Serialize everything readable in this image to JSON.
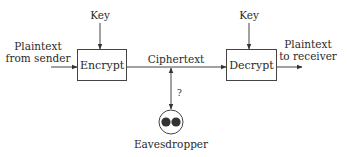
{
  "diagram": {
    "title": "",
    "nodes": {
      "encrypt": {
        "label": "Encrypt"
      },
      "decrypt": {
        "label": "Decrypt"
      },
      "eavesdropper": {
        "label": "Eavesdropper",
        "icon": "eavesdropper-eyes-icon"
      }
    },
    "labels": {
      "key_encrypt": "Key",
      "key_decrypt": "Key",
      "plaintext_in_line1": "Plaintext",
      "plaintext_in_line2": "from sender",
      "ciphertext": "Ciphertext",
      "plaintext_out_line1": "Plaintext",
      "plaintext_out_line2": "to receiver",
      "question": "?"
    },
    "edges": [
      {
        "from": "sender",
        "to": "encrypt",
        "label": "Plaintext from sender"
      },
      {
        "from": "key",
        "to": "encrypt",
        "label": "Key"
      },
      {
        "from": "encrypt",
        "to": "decrypt",
        "label": "Ciphertext"
      },
      {
        "from": "key",
        "to": "decrypt",
        "label": "Key"
      },
      {
        "from": "decrypt",
        "to": "receiver",
        "label": "Plaintext to receiver"
      },
      {
        "from": "ciphertext",
        "to": "eavesdropper",
        "label": "?",
        "bidirectional": true
      }
    ],
    "colors": {
      "line": "#444444",
      "text": "#2a2a2a",
      "eye": "#333333"
    }
  }
}
